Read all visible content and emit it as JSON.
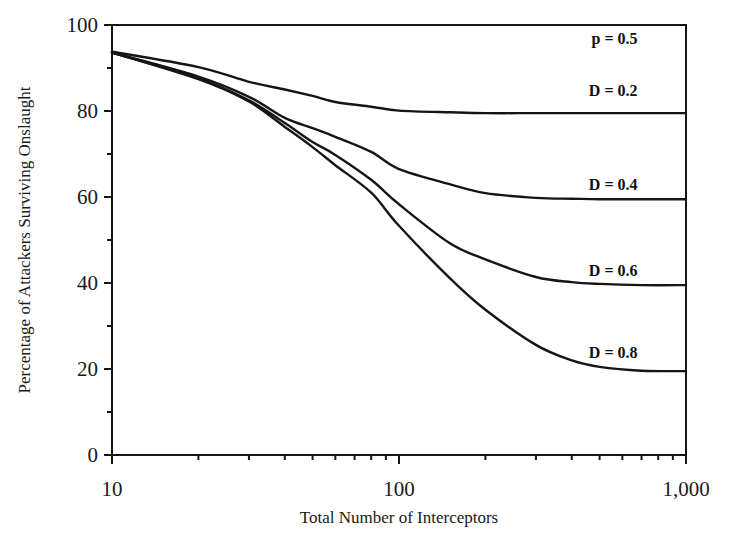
{
  "chart_data": {
    "type": "line",
    "title": "",
    "xlabel": "Total Number of Interceptors",
    "ylabel": "Percentage of Attackers Surviving Onslaught",
    "xscale": "log",
    "xlim": [
      10,
      1000
    ],
    "ylim": [
      0,
      100
    ],
    "grid": false,
    "legend": "none",
    "x_ticks": [
      10,
      100,
      1000
    ],
    "x_tick_labels": [
      "10",
      "100",
      "1,000"
    ],
    "x_minor_ticks": [
      20,
      30,
      40,
      50,
      60,
      70,
      80,
      90,
      200,
      300,
      400,
      500,
      600,
      700,
      800,
      900
    ],
    "y_ticks": [
      0,
      20,
      40,
      60,
      80,
      100
    ],
    "y_tick_labels": [
      "0",
      "20",
      "40",
      "60",
      "80",
      "100"
    ],
    "y_minor_ticks": [
      10,
      30,
      50,
      70,
      90
    ],
    "annotations": [
      {
        "text": "p = 0.5",
        "x": 700,
        "y": 97
      },
      {
        "text": "D = 0.2",
        "x": 700,
        "y": 85
      },
      {
        "text": "D = 0.4",
        "x": 700,
        "y": 63
      },
      {
        "text": "D = 0.6",
        "x": 700,
        "y": 43
      },
      {
        "text": "D = 0.8",
        "x": 700,
        "y": 24
      }
    ],
    "x": [
      10,
      20,
      30,
      40,
      50,
      60,
      80,
      100,
      150,
      200,
      300,
      400,
      500,
      700,
      1000
    ],
    "series": [
      {
        "name": "D = 0.2",
        "values": [
          93.8,
          90.2,
          86.8,
          85.0,
          83.5,
          82.1,
          81.0,
          80.1,
          79.7,
          79.5,
          79.5,
          79.5,
          79.5,
          79.5,
          79.5
        ]
      },
      {
        "name": "D = 0.4",
        "values": [
          93.6,
          88.0,
          83.3,
          78.4,
          76.0,
          74.0,
          70.5,
          66.5,
          63.0,
          60.9,
          59.8,
          59.6,
          59.5,
          59.5,
          59.5
        ]
      },
      {
        "name": "D = 0.6",
        "values": [
          93.6,
          87.6,
          82.5,
          77.2,
          72.8,
          69.8,
          64.0,
          58.3,
          49.3,
          45.5,
          41.4,
          40.2,
          39.8,
          39.5,
          39.5
        ]
      },
      {
        "name": "D = 0.8",
        "values": [
          93.6,
          87.4,
          82.2,
          76.3,
          71.6,
          67.4,
          61.0,
          53.3,
          41.2,
          33.8,
          25.6,
          22.0,
          20.5,
          19.6,
          19.5
        ]
      }
    ]
  }
}
